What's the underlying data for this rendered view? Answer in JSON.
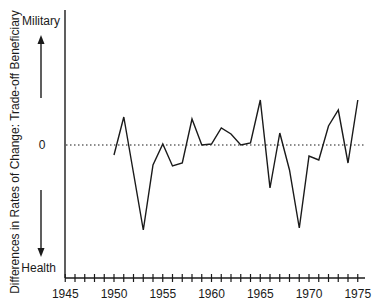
{
  "chart_data": {
    "type": "line",
    "title": "",
    "xlabel": "",
    "ylabel": "Differences in Rates of Change: Trade-off Beneficiary",
    "y_top_label": "Military",
    "y_bottom_label": "Health",
    "y_zero_label": "0",
    "x_ticks": [
      "1945",
      "1950",
      "1955",
      "1960",
      "1965",
      "1970",
      "1975"
    ],
    "xlim": [
      1944,
      1976
    ],
    "ylim": [
      -133,
      135
    ],
    "grid": false,
    "zero_line": "dotted",
    "x": [
      1950,
      1951,
      1952,
      1953,
      1954,
      1955,
      1956,
      1957,
      1958,
      1959,
      1960,
      1961,
      1962,
      1963,
      1964,
      1965,
      1966,
      1967,
      1968,
      1969,
      1970,
      1971,
      1972,
      1973,
      1974,
      1975
    ],
    "series": [
      {
        "name": "Military minus Health rate of change",
        "values": [
          -10,
          28,
          -28,
          -85,
          -20,
          1,
          -21,
          -18,
          26,
          0,
          1,
          17,
          11,
          0,
          2,
          45,
          -43,
          12,
          -25,
          -83,
          -11,
          -15,
          19,
          35,
          -18,
          45
        ]
      }
    ]
  },
  "labels": {
    "military": "Military",
    "health": "Health",
    "zero": "0",
    "ylabel": "Differences in Rates of Change: Trade-off Beneficiary",
    "x_tick_labels": [
      "1945",
      "1950",
      "1955",
      "1960",
      "1965",
      "1970",
      "1975"
    ]
  }
}
